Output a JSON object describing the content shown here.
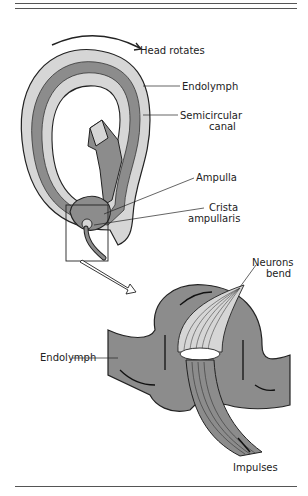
{
  "figure": {
    "labels": {
      "head_rotates": "Head rotates",
      "endolymph_top": "Endolymph",
      "semicircular_1": "Semicircular",
      "semicircular_2": "canal",
      "ampulla": "Ampulla",
      "crista_1": "Crista",
      "crista_2": "ampullaris",
      "neurons_1": "Neurons",
      "neurons_2": "bend",
      "endolymph_bottom": "Endolymph",
      "impulses": "Impulses"
    },
    "colors": {
      "outer_wall": "#d6d6d6",
      "inner_fluid": "#8c8c8c",
      "line": "#222222",
      "rule": "#555555"
    }
  }
}
